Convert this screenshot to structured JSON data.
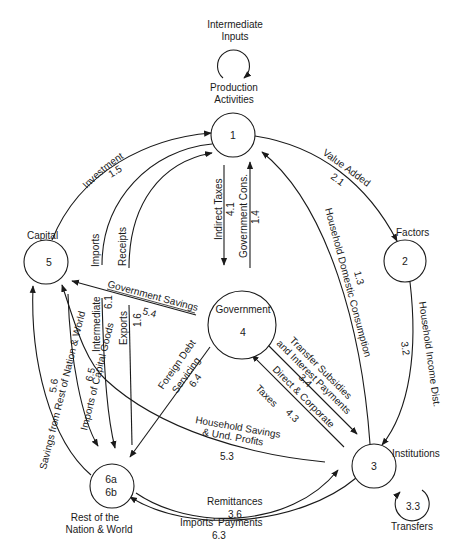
{
  "diagram": {
    "type": "social-accounting-matrix-flow",
    "colors": {
      "line": "#1a1a1a",
      "background": "#ffffff"
    },
    "nodes": [
      {
        "id": "1",
        "label": "Production Activities",
        "label_line1": "Production",
        "label_line2": "Activities",
        "number": "1"
      },
      {
        "id": "2",
        "label": "Factors",
        "number": "2"
      },
      {
        "id": "3",
        "label": "Institutions",
        "number": "3"
      },
      {
        "id": "4",
        "label": "Government",
        "number": "4"
      },
      {
        "id": "5",
        "label": "Capital",
        "number": "5"
      },
      {
        "id": "6",
        "label": "Rest of the Nation & World",
        "label_line1": "Rest of the",
        "label_line2": "Nation & World",
        "number_line1": "6a",
        "number_line2": "6b"
      }
    ],
    "self_loops": [
      {
        "node": "1",
        "label_line1": "Intermediate",
        "label_line2": "Inputs"
      },
      {
        "node": "3",
        "label": "Transfers",
        "code": "3.3"
      }
    ],
    "flows": [
      {
        "id": "f15",
        "from": "5",
        "to": "1",
        "label": "Investment",
        "code": "1.5"
      },
      {
        "id": "f21",
        "from": "1",
        "to": "2",
        "label": "Value Added",
        "code": "2.1"
      },
      {
        "id": "f13",
        "from": "3",
        "to": "1",
        "label": "Household Domestic Consumption",
        "code": "1.3"
      },
      {
        "id": "f32",
        "from": "2",
        "to": "3",
        "label": "Household  Income  Dist.",
        "code": "3.2"
      },
      {
        "id": "f41",
        "from": "1",
        "to": "4",
        "label": "Indirect Taxes",
        "code": "4.1"
      },
      {
        "id": "f14",
        "from": "4",
        "to": "1",
        "label": "Government Cons.",
        "code": "1.4"
      },
      {
        "id": "fimp",
        "from": "1",
        "to": "6",
        "label": "Imports"
      },
      {
        "id": "frec",
        "from": "6",
        "to": "1",
        "label": "Receipts"
      },
      {
        "id": "f54",
        "from": "4",
        "to": "5",
        "label": "Government Savings",
        "code": "5.4"
      },
      {
        "id": "f61",
        "from": "1",
        "to": "6",
        "label": "Intermediate",
        "code": "6.1"
      },
      {
        "id": "f16",
        "from": "1",
        "to": "6",
        "label": "Exports",
        "code": "1.6"
      },
      {
        "id": "f64",
        "from": "4",
        "to": "6",
        "label_line1": "Foreign Debt",
        "label_line2": "Servicing",
        "code": "6.4"
      },
      {
        "id": "f34",
        "from": "4",
        "to": "3",
        "label_line1": "Transfer Subsidies",
        "label_line2": "and Interest Payments",
        "code": "3.4"
      },
      {
        "id": "f43",
        "from": "3",
        "to": "4",
        "label_line1": "Direct & Corporate",
        "label_line2": "Taxes",
        "code": "4.3"
      },
      {
        "id": "f53",
        "from": "3",
        "to": "5",
        "label_line1": "Household Savings",
        "label_line2": "& Und. Profits",
        "code": "5.3"
      },
      {
        "id": "f56",
        "from": "6",
        "to": "5",
        "label": "Savings  from  Rest of Nation & World",
        "code": "5.6"
      },
      {
        "id": "f65",
        "from": "5",
        "to": "6",
        "label": "Imports of Capital Goods",
        "code": "6.5"
      },
      {
        "id": "f36",
        "from": "6",
        "to": "3",
        "label": "Remittances",
        "code": "3.6"
      },
      {
        "id": "f63",
        "from": "3",
        "to": "6",
        "label": "Imports' Payments",
        "code": "6.3"
      }
    ]
  }
}
